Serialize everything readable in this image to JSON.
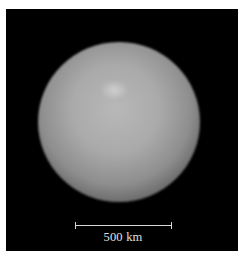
{
  "image": {
    "subject": "planetary-body",
    "background_color": "#000000",
    "frame_color": "#ffffff"
  },
  "scale_bar": {
    "label": "500 km",
    "color": "#d8d8d8"
  }
}
